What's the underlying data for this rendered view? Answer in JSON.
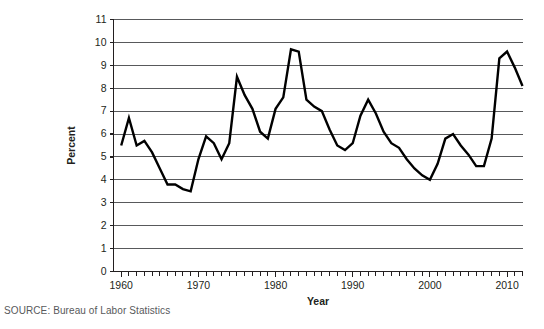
{
  "figure": {
    "source_note": "SOURCE: Bureau of Labor Statistics",
    "line_color": "#000000",
    "grid_color": "#58595b",
    "axis_color": "#231f20"
  },
  "chart_data": {
    "type": "line",
    "title": "",
    "xlabel": "Year",
    "ylabel": "Percent",
    "xlim": [
      1959,
      2012
    ],
    "ylim": [
      0,
      11
    ],
    "grid": "horizontal",
    "legend": "none",
    "ytick_labels": [
      "0",
      "1",
      "2",
      "3",
      "4",
      "5",
      "6",
      "7",
      "8",
      "9",
      "10",
      "11"
    ],
    "ytick_values": [
      0,
      1,
      2,
      3,
      4,
      5,
      6,
      7,
      8,
      9,
      10,
      11
    ],
    "xtick_labels": [
      "1960",
      "1970",
      "1980",
      "1990",
      "2000",
      "2010"
    ],
    "xtick_values": [
      1960,
      1970,
      1980,
      1990,
      2000,
      2010
    ],
    "xminor_step": 1,
    "series": [
      {
        "name": "Unemployment rate",
        "x": [
          1960,
          1961,
          1962,
          1963,
          1964,
          1965,
          1966,
          1967,
          1968,
          1969,
          1970,
          1971,
          1972,
          1973,
          1974,
          1975,
          1976,
          1977,
          1978,
          1979,
          1980,
          1981,
          1982,
          1983,
          1984,
          1985,
          1986,
          1987,
          1988,
          1989,
          1990,
          1991,
          1992,
          1993,
          1994,
          1995,
          1996,
          1997,
          1998,
          1999,
          2000,
          2001,
          2002,
          2003,
          2004,
          2005,
          2006,
          2007,
          2008,
          2009,
          2010,
          2011,
          2012
        ],
        "values": [
          5.5,
          6.7,
          5.5,
          5.7,
          5.2,
          4.5,
          3.8,
          3.8,
          3.6,
          3.5,
          4.9,
          5.9,
          5.6,
          4.9,
          5.6,
          8.5,
          7.7,
          7.1,
          6.1,
          5.8,
          7.1,
          7.6,
          9.7,
          9.6,
          7.5,
          7.2,
          7.0,
          6.2,
          5.5,
          5.3,
          5.6,
          6.8,
          7.5,
          6.9,
          6.1,
          5.6,
          5.4,
          4.9,
          4.5,
          4.2,
          4.0,
          4.7,
          5.8,
          6.0,
          5.5,
          5.1,
          4.6,
          4.6,
          5.8,
          9.3,
          9.6,
          8.9,
          8.1
        ]
      }
    ]
  }
}
